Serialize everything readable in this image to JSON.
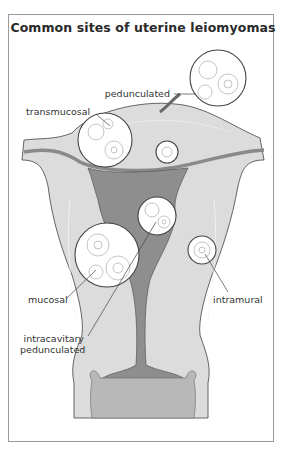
{
  "figure": {
    "title": "Common sites of uterine leiomyomas",
    "labels": {
      "pedunculated": "pedunculated",
      "transmucosal": "transmucosal",
      "mucosal": "mucosal",
      "intramural": "intramural",
      "intracavitary_line1": "intracavitary",
      "intracavitary_line2": "pedunculated"
    },
    "colors": {
      "tissue": "#dcdcdc",
      "tissue_dark": "#c4c4c4",
      "cavity": "#8e8e8e",
      "fibroid": "#ffffff",
      "outline": "#555555",
      "border": "#9a9a9a"
    }
  }
}
